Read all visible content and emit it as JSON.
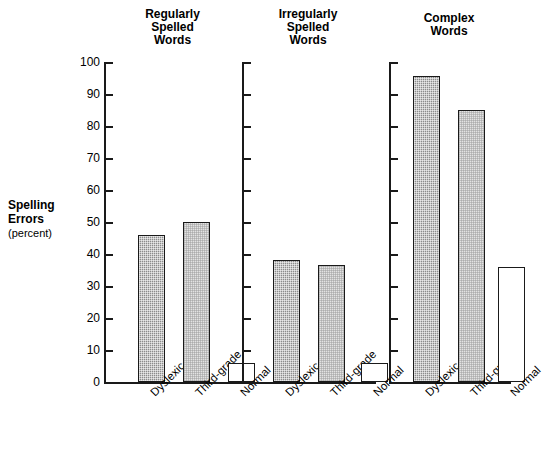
{
  "chart_data": {
    "type": "bar",
    "title": "",
    "subtitle": "",
    "ylabel": "Spelling Errors",
    "ylabel_units": "(percent)",
    "xlabel": "",
    "ylim": [
      0,
      100
    ],
    "ytick_step": 10,
    "yticks": [
      0,
      10,
      20,
      30,
      40,
      50,
      60,
      70,
      80,
      90,
      100
    ],
    "ytick_labels": [
      "0",
      "10",
      "20",
      "30",
      "40",
      "50",
      "60",
      "70",
      "80",
      "90",
      "100"
    ],
    "grid": false,
    "legend": "none",
    "categories": [
      "Dyslexic",
      "Third-grade",
      "Normal"
    ],
    "panels": [
      {
        "title": "Regularly\nSpelled\nWords",
        "title_lines": [
          "Regularly",
          "Spelled",
          "Words"
        ],
        "values": [
          46,
          50,
          6
        ]
      },
      {
        "title": "Irregularly\nSpelled\nWords",
        "title_lines": [
          "Irregularly",
          "Spelled",
          "Words"
        ],
        "values": [
          38,
          36.5,
          6
        ]
      },
      {
        "title": "Complex\nWords",
        "title_lines": [
          "Complex",
          "Words"
        ],
        "values": [
          95.5,
          85,
          36
        ]
      }
    ],
    "series": [
      {
        "name": "Dyslexic",
        "values": [
          46,
          38,
          95.5
        ],
        "fill": "#8c8c8c",
        "pattern": "dense-stipple"
      },
      {
        "name": "Third-grade",
        "values": [
          50,
          36.5,
          85
        ],
        "fill": "#e3e3e3",
        "pattern": "light-stipple"
      },
      {
        "name": "Normal",
        "values": [
          6,
          6,
          36
        ],
        "fill": "#ffffff",
        "pattern": "none"
      }
    ]
  },
  "colors": {
    "ink": "#1a1a1a",
    "background": "#ffffff",
    "bar_dark": "#8c8c8c",
    "bar_light": "#e3e3e3",
    "bar_white": "#ffffff"
  }
}
